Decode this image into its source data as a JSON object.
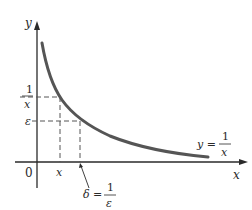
{
  "diagram": {
    "axes": {
      "x_label": "x",
      "y_label": "y",
      "origin_label": "0"
    },
    "y_ticks": {
      "one_over_x": {
        "num": "1",
        "den": "x"
      },
      "epsilon": "ε"
    },
    "x_ticks": {
      "x": "x",
      "delta_lhs": "δ =",
      "delta_num": "1",
      "delta_den": "ε"
    },
    "curve_label": {
      "lhs": "y =",
      "num": "1",
      "den": "x"
    },
    "colors": {
      "curve": "#555555",
      "axes": "#2a2a2a",
      "dashed": "#555555"
    }
  }
}
